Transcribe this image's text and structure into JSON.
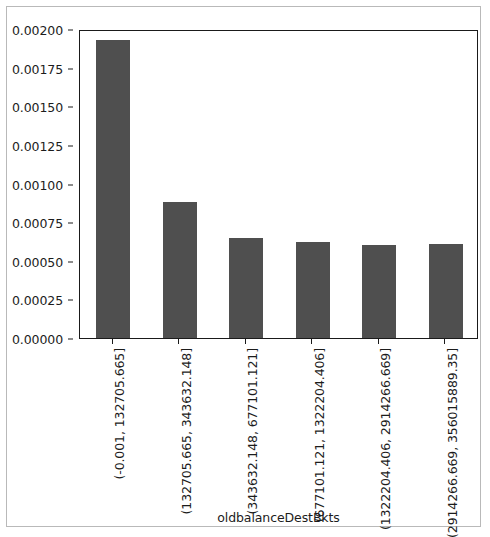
{
  "chart_data": {
    "type": "bar",
    "title": "",
    "xlabel": "oldbalanceDestBkts",
    "ylabel": "",
    "categories": [
      "(-0.001, 132705.665]",
      "(132705.665, 343632.148]",
      "(343632.148, 677101.121]",
      "(677101.121, 1322204.406]",
      "(1322204.406, 2914266.669]",
      "(2914266.669, 356015889.35]"
    ],
    "values": [
      0.00193,
      0.00088,
      0.00065,
      0.00062,
      0.0006,
      0.00061
    ],
    "ylim": [
      0.0,
      0.002
    ],
    "yticks": [
      0.0,
      0.00025,
      0.0005,
      0.00075,
      0.001,
      0.00125,
      0.0015,
      0.00175,
      0.002
    ],
    "ytick_labels": [
      "0.00000",
      "0.00025",
      "0.00050",
      "0.00075",
      "0.00100",
      "0.00125",
      "0.00150",
      "0.00175",
      "0.00200"
    ],
    "grid": false,
    "legend": null,
    "bar_color": "#4f4f4f",
    "axis_color": "#1a1a1a",
    "frame_color": "#b9b9b9",
    "background": "#ffffff"
  }
}
